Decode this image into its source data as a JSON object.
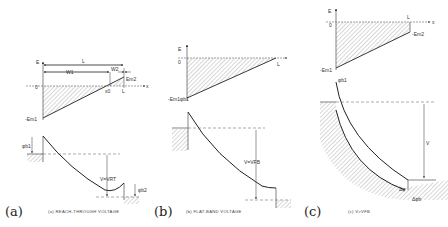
{
  "panels": [
    {
      "letter": "(a)",
      "caption": "(a) REACH-THROUGH VOLTAGE",
      "field_labels": {
        "axis_y": "E",
        "axis_x": "x",
        "origin": "0",
        "length": "L",
        "w1": "W1",
        "w2": "W2",
        "em2": "Em2",
        "em1": "-Em1",
        "x0": "x0",
        "L_tick": "L"
      },
      "band_labels": {
        "phi1": "φb1",
        "phi2": "φb2",
        "voltage": "V=VRT"
      }
    },
    {
      "letter": "(b)",
      "caption": "(b) FLAT-BAND VOLTAGE",
      "field_labels": {
        "axis_y": "E",
        "origin": "0",
        "L_tick": "L",
        "em1": "-Em1"
      },
      "band_labels": {
        "phi1": "φb1",
        "voltage": "V=VFB"
      }
    },
    {
      "letter": "(c)",
      "caption": "(c) V>VFB",
      "field_labels": {
        "axis_y": "E",
        "axis_x": "x",
        "origin": "0",
        "L_tick": "L",
        "em2": "-Em2",
        "em1": "-Em1"
      },
      "band_labels": {
        "phi1": "φb1",
        "voltage": "V",
        "dphi": "Δφb",
        "dphi2": "Δφ"
      }
    }
  ]
}
